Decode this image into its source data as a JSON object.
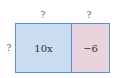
{
  "diagram": {
    "type": "area-model",
    "colors": {
      "border": "#5b8fd0",
      "left_fill": "#c9dcf0",
      "right_fill": "#e9d3dd"
    },
    "top_labels": [
      "?",
      "?"
    ],
    "side_label": "?",
    "cells": [
      {
        "value": "10x"
      },
      {
        "value": "−6"
      }
    ]
  }
}
